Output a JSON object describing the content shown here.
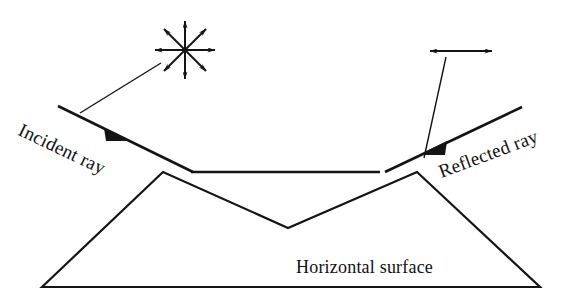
{
  "figure": {
    "background_color": "#ffffff",
    "stroke_color": "#141414",
    "text_color": "#111111",
    "width": 582,
    "height": 305
  },
  "labels": {
    "incident_ray": "Incident ray",
    "reflected_ray": "Reflected ray",
    "horizontal_surface": "Horizontal surface"
  },
  "annotations": {
    "unpolarized_symbol": {
      "name": "eight-point-double-arrow-star",
      "meaning": "unpolarized light",
      "center_x": 185,
      "center_y": 50,
      "radius": 30,
      "spoke_count": 8,
      "double_headed": true
    },
    "polarized_symbol": {
      "name": "horizontal-double-arrow",
      "meaning": "horizontally polarized light",
      "x1": 430,
      "y1": 51,
      "x2": 492,
      "y2": 51,
      "double_headed": true
    },
    "leader_lines": [
      {
        "name": "incident-leader",
        "x1": 80,
        "y1": 113,
        "x2": 162,
        "y2": 62
      },
      {
        "name": "reflected-leader",
        "x1": 424,
        "y1": 158,
        "x2": 447,
        "y2": 56
      }
    ]
  },
  "rays": {
    "incident": {
      "x1": 58,
      "y1": 106,
      "x2": 193,
      "y2": 172,
      "arrow_at_x": 122,
      "arrow_at_y": 137,
      "direction": "down-right"
    },
    "reflected": {
      "x1": 385,
      "y1": 172,
      "x2": 522,
      "y2": 107,
      "arrow_at_x": 437,
      "arrow_at_y": 148,
      "direction": "up-right"
    }
  },
  "surface": {
    "name": "trapezoid-with-v-groove",
    "baseline_y": 287,
    "bottom_left_x": 42,
    "bottom_right_x": 540,
    "left_peak_x": 163,
    "left_peak_y": 172,
    "right_peak_x": 417,
    "right_peak_y": 172,
    "groove_vertex_x": 288,
    "groove_vertex_y": 228,
    "groove_top_line": {
      "x1": 191,
      "y1": 172,
      "x2": 380,
      "y2": 172
    }
  }
}
